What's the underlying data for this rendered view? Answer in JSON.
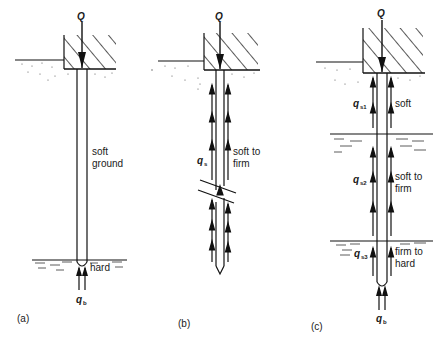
{
  "figure": {
    "panels": [
      {
        "id": "a",
        "caption": "(a)",
        "load_label": "Q",
        "soil_labels": [
          "soft",
          "ground"
        ],
        "bearing_stratum_label": "hard",
        "base_resistance_label": "q",
        "base_resistance_sub": "b"
      },
      {
        "id": "b",
        "caption": "(b)",
        "load_label": "Q",
        "shaft_resistance_label": "q",
        "shaft_resistance_sub": "s",
        "soil_labels": [
          "soft to",
          "firm"
        ]
      },
      {
        "id": "c",
        "caption": "(c)",
        "load_label": "Q",
        "layers": [
          {
            "shaft_label": "q",
            "shaft_sub": "s1",
            "soil": [
              "soft"
            ]
          },
          {
            "shaft_label": "q",
            "shaft_sub": "s2",
            "soil": [
              "soft to",
              "firm"
            ]
          },
          {
            "shaft_label": "q",
            "shaft_sub": "s3",
            "soil": [
              "firm to",
              "hard"
            ]
          }
        ],
        "base_resistance_label": "q",
        "base_resistance_sub": "b"
      }
    ]
  }
}
